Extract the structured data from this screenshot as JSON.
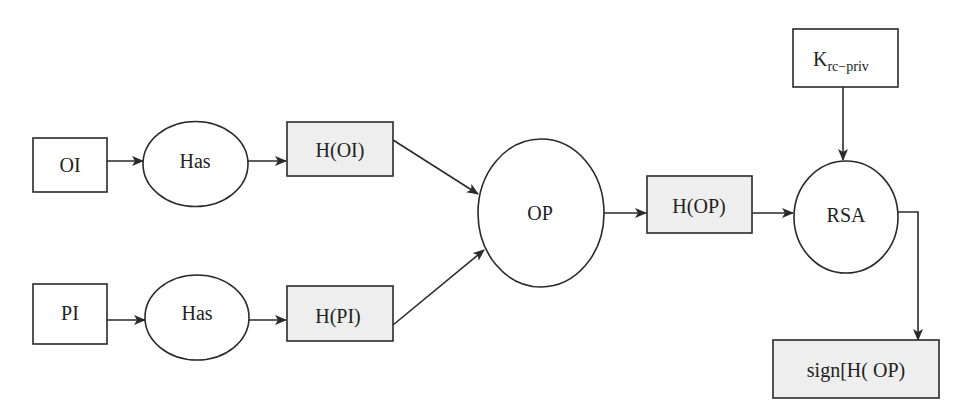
{
  "diagram": {
    "colors": {
      "stroke": "#2a2a2a",
      "shaded_fill": "#eeeeee",
      "plain_fill": "#ffffff",
      "text": "#222222"
    },
    "nodes": {
      "oi": {
        "label": "OI",
        "shape": "rect"
      },
      "pi": {
        "label": "PI",
        "shape": "rect"
      },
      "has1": {
        "label": "Has",
        "shape": "ellipse"
      },
      "has2": {
        "label": "Has",
        "shape": "ellipse"
      },
      "h_oi": {
        "label": "H(OI)",
        "shape": "rect-shaded"
      },
      "h_pi": {
        "label": "H(PI)",
        "shape": "rect-shaded"
      },
      "op": {
        "label": "OP",
        "shape": "ellipse"
      },
      "h_op": {
        "label": "H(OP)",
        "shape": "rect-shaded"
      },
      "rsa": {
        "label": "RSA",
        "shape": "ellipse"
      },
      "key": {
        "label_main": "K",
        "label_sub": "rc−priv",
        "shape": "rect"
      },
      "sign": {
        "label": "sign[H( OP)",
        "shape": "rect-shaded"
      }
    },
    "edges": [
      {
        "from": "OI",
        "to": "Has"
      },
      {
        "from": "Has",
        "to": "H(OI)"
      },
      {
        "from": "PI",
        "to": "Has"
      },
      {
        "from": "Has",
        "to": "H(PI)"
      },
      {
        "from": "H(OI)",
        "to": "OP"
      },
      {
        "from": "H(PI)",
        "to": "OP"
      },
      {
        "from": "OP",
        "to": "H(OP)"
      },
      {
        "from": "H(OP)",
        "to": "RSA"
      },
      {
        "from": "K_rc-priv",
        "to": "RSA"
      },
      {
        "from": "RSA",
        "to": "sign[H(OP)"
      }
    ]
  }
}
